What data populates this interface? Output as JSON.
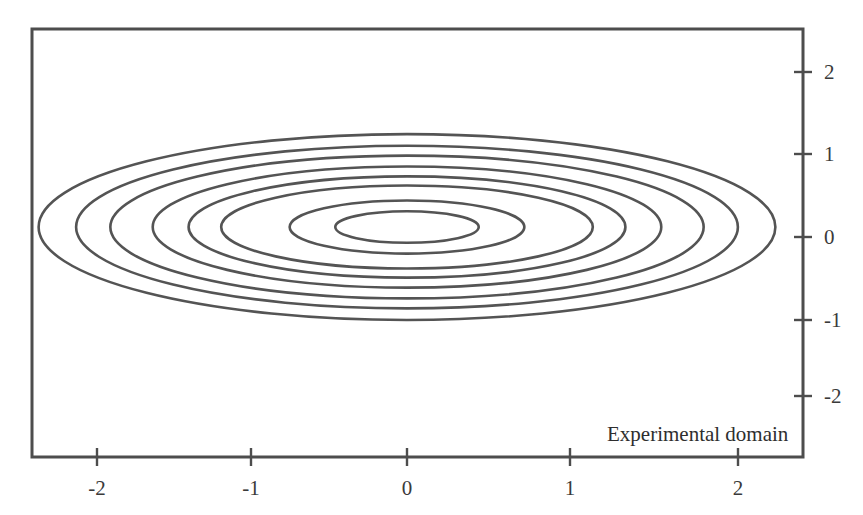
{
  "figure": {
    "title": "",
    "annotation": {
      "text": "Experimental domain",
      "x_px": 607,
      "y_px": 424
    },
    "frame": {
      "left_px": 32,
      "top_px": 29,
      "right_px": 803,
      "bottom_px": 457,
      "color": "#4d4d4d",
      "line_width_px": 3
    },
    "contour_color": "#545454",
    "contour_line_width_px": 2.6,
    "background": "#ffffff"
  },
  "axes": {
    "x": {
      "label": "",
      "ticks": [
        {
          "value": "-2",
          "px": 97
        },
        {
          "value": "-1",
          "px": 251
        },
        {
          "value": "0",
          "px": 407
        },
        {
          "value": "1",
          "px": 570
        },
        {
          "value": "2",
          "px": 738
        }
      ],
      "tick_label_y_px": 478,
      "range": [
        -2.34,
        2.41
      ]
    },
    "y": {
      "label": "",
      "ticks": [
        {
          "value": "2",
          "px": 72
        },
        {
          "value": "1",
          "px": 154
        },
        {
          "value": "0",
          "px": 237
        },
        {
          "value": "-1",
          "px": 320
        },
        {
          "value": "-2",
          "px": 396
        }
      ],
      "tick_label_x_px": 824,
      "range": [
        -2.72,
        2.57
      ]
    }
  },
  "chart_data": {
    "type": "line",
    "subtype": "contour",
    "title": "",
    "xlabel": "",
    "ylabel": "",
    "xlim": [
      -2.34,
      2.41
    ],
    "ylim": [
      -2.72,
      2.57
    ],
    "grid": false,
    "legend": null,
    "annotations": [
      {
        "text": "Experimental domain",
        "x": 1.25,
        "y": -2.3
      }
    ],
    "center": {
      "x": 0.0,
      "y": 0.12
    },
    "contours": [
      {
        "index": 1,
        "semi_axis_x": 0.44,
        "semi_axis_y": 0.19
      },
      {
        "index": 2,
        "semi_axis_x": 0.72,
        "semi_axis_y": 0.32
      },
      {
        "index": 3,
        "semi_axis_x": 1.14,
        "semi_axis_y": 0.5
      },
      {
        "index": 4,
        "semi_axis_x": 1.34,
        "semi_axis_y": 0.61
      },
      {
        "index": 5,
        "semi_axis_x": 1.56,
        "semi_axis_y": 0.73
      },
      {
        "index": 6,
        "semi_axis_x": 1.82,
        "semi_axis_y": 0.86
      },
      {
        "index": 7,
        "semi_axis_x": 2.03,
        "semi_axis_y": 0.98
      },
      {
        "index": 8,
        "semi_axis_x": 2.26,
        "semi_axis_y": 1.12
      }
    ]
  }
}
